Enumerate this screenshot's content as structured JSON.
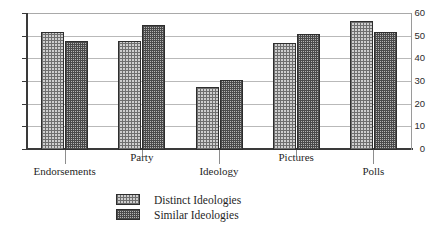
{
  "chart_data": {
    "type": "bar",
    "title": "",
    "xlabel": "",
    "ylabel": "",
    "ylim": [
      0,
      60
    ],
    "yticks": [
      0,
      10,
      20,
      30,
      40,
      50,
      60
    ],
    "grid": true,
    "legend_position": "bottom-left",
    "categories": [
      "Endorsements",
      "Party",
      "Ideology",
      "Pictures",
      "Polls"
    ],
    "series": [
      {
        "name": "Distinct Ideologies",
        "values": [
          52,
          48,
          28,
          47,
          57
        ]
      },
      {
        "name": "Similar Ideologies",
        "values": [
          48,
          55,
          31,
          51,
          52
        ]
      }
    ]
  },
  "legend": {
    "items": [
      {
        "label": "Distinct Ideologies"
      },
      {
        "label": "Similar Ideologies"
      }
    ]
  }
}
